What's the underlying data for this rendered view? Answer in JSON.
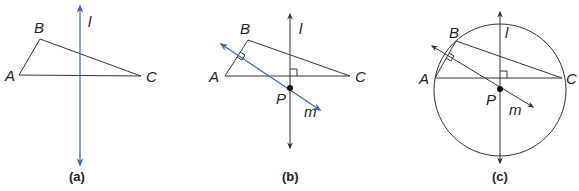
{
  "figure": {
    "panels": [
      {
        "caption": "(a)",
        "points": {
          "A": "A",
          "B": "B",
          "C": "C"
        },
        "lines": {
          "l": "l"
        }
      },
      {
        "caption": "(b)",
        "points": {
          "A": "A",
          "B": "B",
          "C": "C",
          "P": "P"
        },
        "lines": {
          "l": "l",
          "m": "m"
        }
      },
      {
        "caption": "(c)",
        "points": {
          "A": "A",
          "B": "B",
          "C": "C",
          "P": "P"
        },
        "lines": {
          "l": "l",
          "m": "m"
        }
      }
    ],
    "colors": {
      "accent_line": "#3a63b8",
      "ink": "#333333"
    }
  }
}
